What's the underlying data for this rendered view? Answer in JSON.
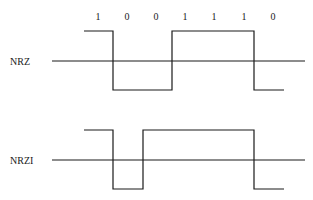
{
  "diagram": {
    "bits": [
      "1",
      "0",
      "0",
      "1",
      "1",
      "1",
      "0"
    ],
    "signals": [
      {
        "name": "NRZ",
        "levels": [
          "high",
          "low",
          "low",
          "high",
          "high",
          "high",
          "low"
        ]
      },
      {
        "name": "NRZI",
        "levels": [
          "high",
          "low",
          "high",
          "high",
          "high",
          "high",
          "low"
        ]
      }
    ]
  }
}
